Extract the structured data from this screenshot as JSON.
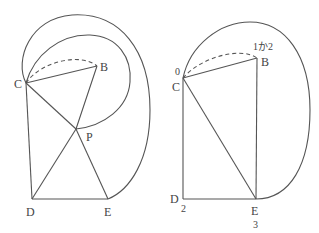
{
  "figures": [
    {
      "id": "left",
      "points": {
        "C": {
          "label": "C",
          "x": 26,
          "y": 83
        },
        "B": {
          "label": "B",
          "x": 97,
          "y": 66
        },
        "P": {
          "label": "P",
          "x": 76,
          "y": 129
        },
        "D": {
          "label": "D",
          "x": 32,
          "y": 199
        },
        "E": {
          "label": "E",
          "x": 108,
          "y": 199
        }
      },
      "segments": [
        "CB",
        "BP",
        "CP",
        "CD",
        "DE",
        "DP",
        "PE"
      ],
      "dashed_arc": "C-B",
      "loops": [
        "outer C to E",
        "inner C to P"
      ]
    },
    {
      "id": "right",
      "points": {
        "C": {
          "label": "C",
          "x": 183,
          "y": 78,
          "annotation": "0"
        },
        "B": {
          "label": "B",
          "x": 257,
          "y": 58,
          "annotation": "1か2"
        },
        "D": {
          "label": "D",
          "x": 183,
          "y": 199,
          "annotation": "2"
        },
        "E": {
          "label": "E",
          "x": 256,
          "y": 199,
          "annotation": "3"
        }
      },
      "segments": [
        "CB",
        "BE",
        "CE",
        "CD",
        "DE"
      ],
      "dashed_arc": "C-B",
      "loops": [
        "outer C to E"
      ]
    }
  ]
}
